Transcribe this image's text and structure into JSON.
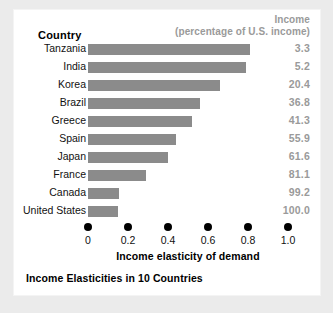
{
  "chart_data": {
    "type": "bar",
    "title": "Income Elasticities in 10 Countries",
    "xlabel": "Income elasticity of demand",
    "ylabel": "Country",
    "orientation": "horizontal",
    "grid": false,
    "legend": "none",
    "xlim": [
      0,
      1.0
    ],
    "xticks": [
      "0",
      "0.2",
      "0.4",
      "0.6",
      "0.8",
      "1.0"
    ],
    "xtick_values": [
      0,
      0.2,
      0.4,
      0.6,
      0.8,
      1.0
    ],
    "categories": [
      "Tanzania",
      "India",
      "Korea",
      "Brazil",
      "Greece",
      "Spain",
      "Japan",
      "France",
      "Canada",
      "United States"
    ],
    "values": [
      0.81,
      0.79,
      0.66,
      0.56,
      0.52,
      0.44,
      0.4,
      0.29,
      0.155,
      0.15
    ],
    "series": [
      {
        "name": "Income elasticity of demand",
        "values": [
          0.81,
          0.79,
          0.66,
          0.56,
          0.52,
          0.44,
          0.4,
          0.29,
          0.155,
          0.15
        ]
      },
      {
        "name": "Income (percentage of U.S. income)",
        "values": [
          3.3,
          5.2,
          20.4,
          36.8,
          41.3,
          55.9,
          61.6,
          81.1,
          99.2,
          100.0
        ]
      }
    ],
    "bar_color": "#8b8b8b",
    "value_color": "#9a9a9a"
  },
  "header": {
    "country_label": "Country",
    "income_line1": "Income",
    "income_line2": "(percentage of U.S. income)"
  },
  "rows": [
    {
      "country": "Tanzania",
      "elasticity": 0.81,
      "income": "3.3"
    },
    {
      "country": "India",
      "elasticity": 0.79,
      "income": "5.2"
    },
    {
      "country": "Korea",
      "elasticity": 0.66,
      "income": "20.4"
    },
    {
      "country": "Brazil",
      "elasticity": 0.56,
      "income": "36.8"
    },
    {
      "country": "Greece",
      "elasticity": 0.52,
      "income": "41.3"
    },
    {
      "country": "Spain",
      "elasticity": 0.44,
      "income": "55.9"
    },
    {
      "country": "Japan",
      "elasticity": 0.4,
      "income": "61.6"
    },
    {
      "country": "France",
      "elasticity": 0.29,
      "income": "81.1"
    },
    {
      "country": "Canada",
      "elasticity": 0.155,
      "income": "99.2"
    },
    {
      "country": "United States",
      "elasticity": 0.15,
      "income": "100.0"
    }
  ],
  "axis": {
    "ticks": [
      "0",
      "0.2",
      "0.4",
      "0.6",
      "0.8",
      "1.0"
    ],
    "tick_values": [
      0,
      0.2,
      0.4,
      0.6,
      0.8,
      1.0
    ],
    "xlabel": "Income elasticity of demand"
  },
  "caption": "Income Elasticities in 10 Countries"
}
